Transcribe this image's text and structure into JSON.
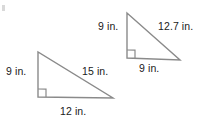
{
  "figure": {
    "type": "geometry-diagram",
    "background_color": "#ffffff",
    "stroke_color": "#8a8a8a",
    "label_color": "#1a1a1a",
    "unit": "in.",
    "shapes": [
      {
        "name": "left-triangle",
        "kind": "right-triangle",
        "right_angle_at": "bottom-left",
        "vertices": {
          "apex": [
            38,
            52
          ],
          "right_angle": [
            38,
            97
          ],
          "bottom_right": [
            113,
            98
          ]
        },
        "sides": {
          "vertical_leg": "9 in.",
          "hypotenuse": "15 in.",
          "base": "12 in."
        }
      },
      {
        "name": "right-triangle",
        "kind": "right-triangle",
        "right_angle_at": "bottom-left",
        "vertices": {
          "apex": [
            127,
            13
          ],
          "right_angle": [
            127,
            58
          ],
          "bottom_right": [
            180,
            60
          ]
        },
        "sides": {
          "vertical_leg": "9 in.",
          "hypotenuse": "12.7 in.",
          "base": "9 in."
        }
      }
    ]
  }
}
